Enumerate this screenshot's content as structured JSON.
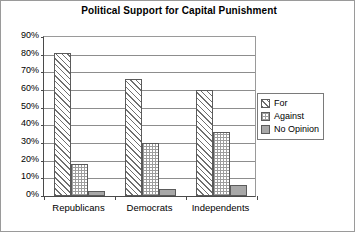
{
  "chart_data": {
    "type": "bar",
    "title": "Political Support for Capital Punishment",
    "xlabel": "",
    "ylabel": "",
    "categories": [
      "Republicans",
      "Democrats",
      "Independents"
    ],
    "series": [
      {
        "name": "For",
        "values": [
          81,
          66,
          60
        ]
      },
      {
        "name": "Against",
        "values": [
          18,
          30,
          36
        ]
      },
      {
        "name": "No Opinion",
        "values": [
          3,
          4,
          6
        ]
      }
    ],
    "ylim": [
      0,
      90
    ],
    "ytick_labels": [
      "90%",
      "80%",
      "70%",
      "60%",
      "50%",
      "40%",
      "30%",
      "20%",
      "10%",
      "0%"
    ],
    "ytick_values": [
      90,
      80,
      70,
      60,
      50,
      40,
      30,
      20,
      10,
      0
    ],
    "grid": true,
    "legend_position": "right",
    "value_suffix": "%"
  },
  "legend": {
    "items": [
      {
        "label": "For",
        "pattern": "diagonal-hatch"
      },
      {
        "label": "Against",
        "pattern": "cross-hatch-dots"
      },
      {
        "label": "No Opinion",
        "pattern": "solid-gray"
      }
    ]
  },
  "colors": {
    "background": "#ffffff",
    "axis": "#4a4a4a",
    "gridline": "#8d8d8d",
    "bar_outline": "#5b5b5b",
    "no_opinion_fill": "#a8a8a8",
    "frame_border": "#9a9a9a",
    "text": "#000000"
  }
}
